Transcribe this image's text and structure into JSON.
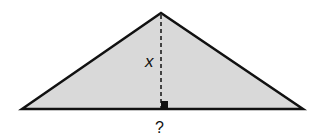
{
  "diagram": {
    "type": "triangle-with-altitude",
    "fill_color": "#d9d9d9",
    "stroke_color": "#111111",
    "vertices": {
      "left": [
        22,
        109
      ],
      "apex": [
        161,
        13
      ],
      "right": [
        303,
        109
      ]
    },
    "altitude": {
      "from": [
        161,
        14
      ],
      "to": [
        161,
        109
      ],
      "style": "dashed"
    },
    "labels": {
      "height": "x",
      "base": "?"
    }
  }
}
